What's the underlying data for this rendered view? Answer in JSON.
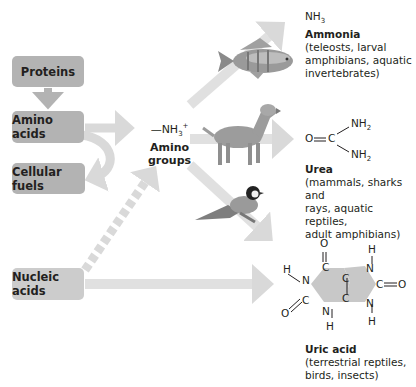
{
  "sources": {
    "proteins": "Proteins",
    "amino_acids": "Amino acids",
    "cellular_fuels": "Cellular fuels",
    "nucleic_acids": "Nucleic acids"
  },
  "intermediate": {
    "formula_prefix": "—NH",
    "formula_sub": "3",
    "formula_sup": "+",
    "name_line1": "Amino",
    "name_line2": "groups"
  },
  "products": {
    "ammonia": {
      "formula": "NH",
      "formula_sub": "3",
      "name": "Ammonia",
      "organisms": [
        "(teleosts, larval",
        "amphibians, aquatic",
        "invertebrates)"
      ]
    },
    "urea": {
      "atoms": {
        "o": "O",
        "c": "C",
        "nh_top": "NH",
        "nh_bottom": "NH",
        "sub": "2"
      },
      "name": "Urea",
      "organisms": [
        "(mammals, sharks and",
        "rays, aquatic reptiles,",
        "adult amphibians)"
      ]
    },
    "uric_acid": {
      "name": "Uric acid",
      "organisms": [
        "(terrestrial reptiles,",
        "birds, insects)"
      ]
    }
  },
  "animals": [
    "fish",
    "dog",
    "bird"
  ],
  "colors": {
    "box": "#b3b3b3",
    "arrow": "#d9d9d9",
    "text": "#231f20",
    "ring_fill": "#c8c8c8"
  }
}
